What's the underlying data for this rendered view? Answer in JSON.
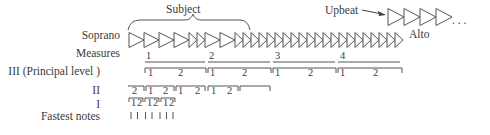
{
  "labels": {
    "subject": "Subject",
    "upbeat": "Upbeat",
    "alto": "Alto",
    "ellipsis": ". . .",
    "soprano": "Soprano",
    "measures": "Measures",
    "level3": "III (Principal level )",
    "level2": "II",
    "level1": "I",
    "fastest": "Fastest notes"
  },
  "measures": [
    "1",
    "2",
    "3",
    "4"
  ],
  "level3_beats": [
    "1",
    "2"
  ],
  "level2_pickup": "2",
  "level2_beats": [
    "1",
    "2"
  ],
  "level1_beats": [
    "1",
    "2"
  ],
  "fastest_note_count": 7
}
